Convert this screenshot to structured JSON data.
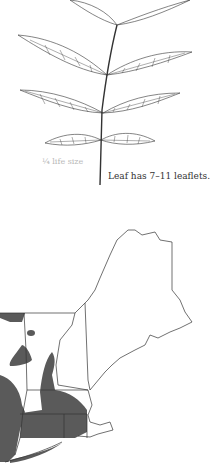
{
  "leaf": {
    "scale_label": "¼ life size",
    "caption": "Leaf has 7–11 leaflets."
  },
  "map": {
    "region": "New England range map",
    "range_color": "#5a5a5a",
    "outline_color": "#333333"
  }
}
